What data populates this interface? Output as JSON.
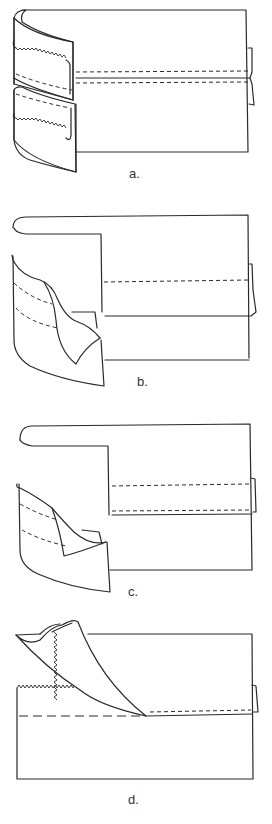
{
  "figure": {
    "type": "sewing-seam-finishing-diagram",
    "panels": [
      {
        "id": "a",
        "label": "a.",
        "description": "Seam pressed open with pinked edges folded back at left"
      },
      {
        "id": "b",
        "label": "b.",
        "description": "Fabric layer folded over with corner turned back, single stitch line"
      },
      {
        "id": "c",
        "label": "c.",
        "description": "Fabric layer folded over with corner turned back, double stitch lines"
      },
      {
        "id": "d",
        "label": "d.",
        "description": "Pinked edge layer peeled back showing long-dash stitch line"
      }
    ]
  },
  "colors": {
    "line": "#2a2a2a",
    "background": "#ffffff"
  }
}
